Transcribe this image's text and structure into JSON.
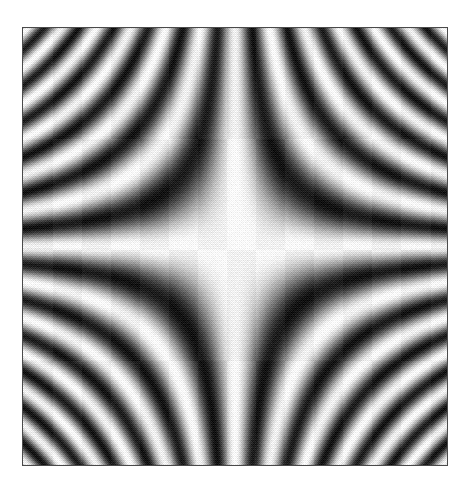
{
  "figure": {
    "kind": "density-plot",
    "background_color": "#ffffff",
    "frame_border_color": "#4a4a4a",
    "frame_border_width_px": 1,
    "frame": {
      "x": 22,
      "y": 27,
      "width": 426,
      "height": 439
    },
    "rendering": {
      "style": "halftone-dither-grayscale",
      "dither_matrix": "bayer-4x4",
      "grain_strength": 0.42,
      "colormap": "grayscale",
      "colormap_min_color": "#1c1c1c",
      "colormap_max_color": "#fbfbfb"
    }
  },
  "chart_data": {
    "type": "heatmap",
    "title": "",
    "subtitle": "",
    "xlabel": "",
    "ylabel": "",
    "grid": false,
    "legend": "none",
    "axis_ticks_visible": false,
    "function": "cos(x*y)",
    "xlim": [
      -6.2,
      6.2
    ],
    "ylim": [
      -6.2,
      6.2
    ],
    "zlim": [
      -1,
      1
    ],
    "symmetry": "4-fold mirror about both center axes",
    "features": [
      "dark four-pointed star region centered at origin",
      "bright caustic ridges along the horizontal and vertical center axes",
      "nested hyperbolic bright arcs (level sets of x*y) filling all four corners",
      "band frequency increases toward the corners"
    ],
    "x": [
      -6.2,
      -4.96,
      -3.72,
      -2.48,
      -1.24,
      0,
      1.24,
      2.48,
      3.72,
      4.96,
      6.2
    ],
    "y": [
      -6.2,
      -4.96,
      -3.72,
      -2.48,
      -1.24,
      0,
      1.24,
      2.48,
      3.72,
      4.96,
      6.2
    ],
    "z": [
      [
        -0.73,
        0.43,
        0.64,
        -0.99,
        0.28,
        1.0,
        0.28,
        -0.99,
        0.64,
        0.43,
        -0.73
      ],
      [
        0.43,
        -0.45,
        0.99,
        -0.2,
        -0.82,
        1.0,
        -0.82,
        -0.2,
        0.99,
        -0.45,
        0.43
      ],
      [
        0.64,
        0.99,
        -0.58,
        0.47,
        0.02,
        1.0,
        0.02,
        0.47,
        -0.58,
        0.99,
        0.64
      ],
      [
        -0.99,
        -0.2,
        0.47,
        0.96,
        0.52,
        1.0,
        0.52,
        0.96,
        0.47,
        -0.2,
        -0.99
      ],
      [
        0.28,
        -0.82,
        0.02,
        0.52,
        0.88,
        1.0,
        0.88,
        0.52,
        0.02,
        -0.82,
        0.28
      ],
      [
        1.0,
        1.0,
        1.0,
        1.0,
        1.0,
        1.0,
        1.0,
        1.0,
        1.0,
        1.0,
        1.0
      ],
      [
        0.28,
        -0.82,
        0.02,
        0.52,
        0.88,
        1.0,
        0.88,
        0.52,
        0.02,
        -0.82,
        0.28
      ],
      [
        -0.99,
        -0.2,
        0.47,
        0.96,
        0.52,
        1.0,
        0.52,
        0.96,
        0.47,
        -0.2,
        -0.99
      ],
      [
        0.64,
        0.99,
        -0.58,
        0.47,
        0.02,
        1.0,
        0.02,
        0.47,
        -0.58,
        0.99,
        0.64
      ],
      [
        0.43,
        -0.45,
        0.99,
        -0.2,
        -0.82,
        1.0,
        -0.82,
        -0.2,
        0.99,
        -0.45,
        0.43
      ],
      [
        -0.73,
        0.43,
        0.64,
        -0.99,
        0.28,
        1.0,
        0.28,
        -0.99,
        0.64,
        0.43,
        -0.73
      ]
    ]
  }
}
